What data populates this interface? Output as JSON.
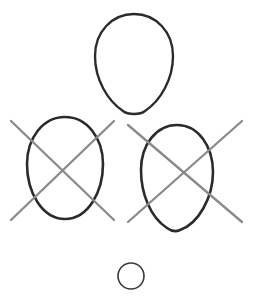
{
  "canvas": {
    "width": 263,
    "height": 299,
    "background_color": "#ffffff",
    "title": "Hand-drawn oval shapes diagram"
  },
  "palette": {
    "outline_color": "#2b2b2b",
    "cross_color": "#8a8a8a",
    "small_circle_color": "#3a3a3a",
    "background_color": "#ffffff"
  },
  "chart_data": {
    "type": "diagram",
    "shapes": [
      {
        "id": "top-egg",
        "label": "Top egg outline",
        "kind": "egg",
        "crossed_out": false,
        "stroke_color": "#2b2b2b",
        "stroke_width": 2.4,
        "center_x": 134,
        "center_y": 64,
        "width": 78,
        "height": 100,
        "bbox": [
          95,
          14,
          173,
          114
        ]
      },
      {
        "id": "left-egg",
        "label": "Left egg outline, crossed out",
        "kind": "egg",
        "crossed_out": true,
        "stroke_color": "#2b2b2b",
        "stroke_width": 2.6,
        "center_x": 65,
        "center_y": 168,
        "width": 76,
        "height": 102,
        "bbox": [
          27,
          117,
          103,
          219
        ]
      },
      {
        "id": "right-egg",
        "label": "Right egg outline, crossed out",
        "kind": "egg",
        "crossed_out": true,
        "stroke_color": "#2b2b2b",
        "stroke_width": 2.6,
        "center_x": 177,
        "center_y": 178,
        "width": 72,
        "height": 106,
        "bbox": [
          141,
          125,
          213,
          231
        ]
      },
      {
        "id": "bottom-circle",
        "label": "Small circle outline",
        "kind": "circle",
        "crossed_out": false,
        "stroke_color": "#3a3a3a",
        "stroke_width": 1.6,
        "center_x": 131,
        "center_y": 276,
        "width": 26,
        "height": 26,
        "bbox": [
          118,
          263,
          144,
          289
        ]
      }
    ],
    "cross_marks": [
      {
        "id": "left-cross",
        "label": "Gray X over left egg",
        "target": "left-egg",
        "stroke_color": "#8a8a8a",
        "stroke_width": 2.3,
        "lines": [
          {
            "x1": 11,
            "y1": 121,
            "x2": 114,
            "y2": 220
          },
          {
            "x1": 114,
            "y1": 121,
            "x2": 11,
            "y2": 220
          }
        ]
      },
      {
        "id": "right-cross",
        "label": "Gray X over right egg",
        "target": "right-egg",
        "stroke_color": "#8a8a8a",
        "stroke_width": 2.3,
        "lines": [
          {
            "x1": 128,
            "y1": 125,
            "x2": 242,
            "y2": 222
          },
          {
            "x1": 242,
            "y1": 121,
            "x2": 128,
            "y2": 222
          }
        ]
      }
    ],
    "counts": {
      "total_shapes": 4,
      "crossed_out": 2,
      "not_crossed_out": 2,
      "cross_marks": 2
    }
  }
}
